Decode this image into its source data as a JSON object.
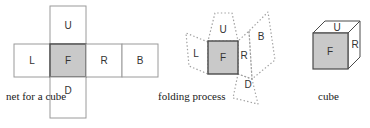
{
  "figure": {
    "colors": {
      "face_fill_gray": "#c9c9c9",
      "face_fill_white": "#ffffff",
      "solid_stroke_light": "#9a9a9a",
      "solid_stroke_dark": "#4a4a4a",
      "dotted_stroke": "#a0a0a0",
      "label_color": "#333333",
      "caption_color": "#1a1a1a",
      "background": "#ffffff"
    },
    "panels": [
      {
        "id": "net",
        "caption": "net for a cube",
        "faces": [
          {
            "key": "U",
            "label": "U",
            "highlight": false
          },
          {
            "key": "L",
            "label": "L",
            "highlight": false
          },
          {
            "key": "F",
            "label": "F",
            "highlight": true
          },
          {
            "key": "R",
            "label": "R",
            "highlight": false
          },
          {
            "key": "B",
            "label": "B",
            "highlight": false
          },
          {
            "key": "D",
            "label": "D",
            "highlight": false
          }
        ]
      },
      {
        "id": "folding",
        "caption": "folding process",
        "faces": [
          {
            "key": "U",
            "label": "U",
            "highlight": false
          },
          {
            "key": "L",
            "label": "L",
            "highlight": false
          },
          {
            "key": "F",
            "label": "F",
            "highlight": true
          },
          {
            "key": "R",
            "label": "R",
            "highlight": false
          },
          {
            "key": "B",
            "label": "B",
            "highlight": false
          },
          {
            "key": "D",
            "label": "D",
            "highlight": false
          }
        ]
      },
      {
        "id": "cube",
        "caption": "cube",
        "faces": [
          {
            "key": "U",
            "label": "U",
            "highlight": false
          },
          {
            "key": "F",
            "label": "F",
            "highlight": true
          },
          {
            "key": "R",
            "label": "R",
            "highlight": false
          }
        ]
      }
    ],
    "labels": {
      "net_U": "U",
      "net_L": "L",
      "net_F": "F",
      "net_R": "R",
      "net_B": "B",
      "net_D": "D",
      "fold_U": "U",
      "fold_L": "L",
      "fold_F": "F",
      "fold_R": "R",
      "fold_B": "B",
      "fold_D": "D",
      "cube_U": "U",
      "cube_F": "F",
      "cube_R": "R"
    },
    "captions": {
      "net": "net for a cube",
      "folding": "folding process",
      "cube": "cube"
    }
  }
}
